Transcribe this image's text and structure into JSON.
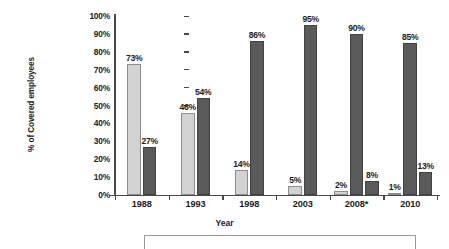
{
  "chart_data": {
    "type": "bar",
    "title": "",
    "xlabel": "Year",
    "ylabel": "% of Covered employees",
    "categories": [
      "1988",
      "1993",
      "1998",
      "2003",
      "2008*",
      "2010"
    ],
    "ylim": [
      0,
      100
    ],
    "ytick_labels": [
      "0%",
      "10%",
      "20%",
      "30%",
      "40%",
      "50%",
      "60%",
      "70%",
      "80%",
      "90%",
      "100%"
    ],
    "ytick_values": [
      0,
      10,
      20,
      30,
      40,
      50,
      60,
      70,
      80,
      90,
      100
    ],
    "grid": false,
    "legend_position": "bottom",
    "orientation": "vertical",
    "series": [
      {
        "name": "series-1",
        "color": "#d2d2d2",
        "values": [
          73,
          46,
          14,
          5,
          2,
          1
        ],
        "labels": [
          "73%",
          "46%",
          "14%",
          "5%",
          "2%",
          "1%"
        ]
      },
      {
        "name": "series-2",
        "color": "#5a5a5a",
        "values": [
          27,
          54,
          86,
          95,
          90,
          85
        ],
        "labels": [
          "27%",
          "54%",
          "86%",
          "95%",
          "90%",
          "85%"
        ]
      },
      {
        "name": "series-3",
        "color": "#5a5a5a",
        "values": [
          null,
          null,
          null,
          null,
          8,
          13
        ],
        "labels": [
          "",
          "",
          "",
          "",
          "8%",
          "13%"
        ]
      }
    ]
  },
  "axes": {
    "y_title": "% of Covered employees",
    "x_title": "Year"
  },
  "colors": {
    "series1": "#d2d2d2",
    "series2": "#5a5a5a",
    "series3": "#5a5a5a",
    "axis": "#4a4a4a",
    "text": "#1d1d1d",
    "background": "#ffffff"
  }
}
